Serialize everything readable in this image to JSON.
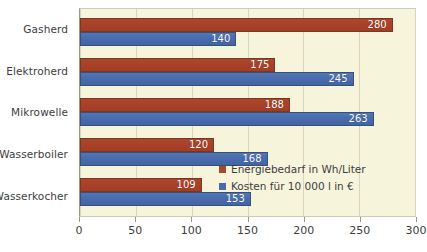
{
  "chart_data": {
    "type": "bar",
    "orientation": "horizontal",
    "title": "",
    "xlabel": "",
    "ylabel": "",
    "xlim": [
      0,
      300
    ],
    "xticks": [
      0,
      50,
      100,
      150,
      200,
      250,
      300
    ],
    "grid": true,
    "legend_position": "inside-bottom-right",
    "categories": [
      "Gasherd",
      "Elektroherd",
      "Mikrowelle",
      "Wasserboiler",
      "Wasserkocher"
    ],
    "series": [
      {
        "name": "Energiebedarf in Wh/Liter",
        "color": "#a5492c",
        "values": [
          280,
          175,
          188,
          120,
          109
        ]
      },
      {
        "name": "Kosten für 10 000 l in €",
        "color": "#4a6cae",
        "values": [
          140,
          245,
          263,
          168,
          153
        ]
      }
    ],
    "colors": {
      "plot_background": "#f7f4dc",
      "page_background": "#ffffff",
      "gridline": "#d8d5bb",
      "axis": "#9a9a80",
      "text": "#3d3d3d",
      "data_label": "#ffffff"
    }
  }
}
